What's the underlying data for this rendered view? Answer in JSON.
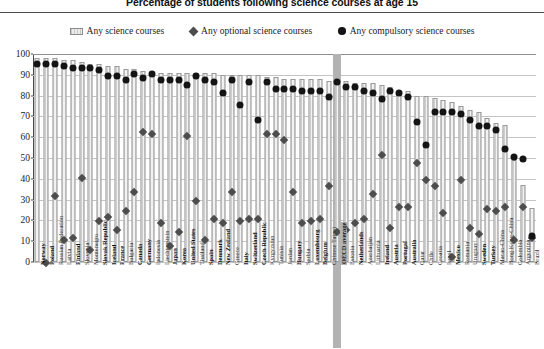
{
  "chart_data": {
    "type": "bar",
    "title": "Percentage of students following science courses at age 15",
    "xlabel": "",
    "ylabel": "Percentage of students",
    "ylim": [
      0,
      100
    ],
    "ytick_values": [
      0,
      10,
      20,
      30,
      40,
      50,
      60,
      70,
      80,
      90,
      100
    ],
    "grid": true,
    "legend_position": "top-center",
    "legend": [
      {
        "label": "Any science courses",
        "marker": "bar",
        "color": "#e6e6e6"
      },
      {
        "label": "Any optional science courses",
        "marker": "diamond",
        "color": "#4d4d4d"
      },
      {
        "label": "Any compulsory science courses",
        "marker": "circle",
        "color": "#141414"
      }
    ],
    "categories": [
      "Norway",
      "Poland",
      "Russian Federation",
      "Latvia",
      "Finland",
      "Slovenia",
      "Montenegro",
      "Slovak Republic",
      "Iceland",
      "France",
      "Bulgaria",
      "Canada",
      "Germany",
      "Indonesia",
      "Liechtenstein",
      "Japan",
      "Korea",
      "United States",
      "Thailand",
      "Spain",
      "Denmark",
      "New Zealand",
      "Greece",
      "Italy",
      "Switzerland",
      "Czech Republic",
      "Kyrgyzstan",
      "Tunisia",
      "Jordan",
      "Hungary",
      "Serbia",
      "Luxembourg",
      "Belgium",
      "Chinese Taipei",
      "OECD average",
      "Estonia",
      "Netherlands",
      "Azerbaijan",
      "Lithuania",
      "Ireland",
      "Austria",
      "Portugal",
      "Australia",
      "Qatar",
      "Chile",
      "Croatia",
      "Israel",
      "Mexico",
      "Romania",
      "Uruguay",
      "Sweden",
      "Turkey",
      "Macao-China",
      "Hong Kong-China",
      "Colombia",
      "Argentina",
      "Brazil"
    ],
    "bold_categories": [
      "Norway",
      "Poland",
      "Finland",
      "Slovak Republic",
      "Iceland",
      "France",
      "Canada",
      "Germany",
      "Japan",
      "Korea",
      "United States",
      "Spain",
      "Denmark",
      "New Zealand",
      "Italy",
      "Switzerland",
      "Czech Republic",
      "Hungary",
      "Luxembourg",
      "Belgium",
      "OECD average",
      "Netherlands",
      "Ireland",
      "Austria",
      "Portugal",
      "Australia",
      "Mexico",
      "Sweden",
      "Turkey"
    ],
    "highlight_category": "OECD average",
    "series": [
      {
        "name": "Any science courses",
        "marker": "bar",
        "values": [
          98,
          98,
          98,
          97,
          97,
          96,
          95,
          95,
          94,
          94,
          93,
          93,
          92,
          92,
          91,
          91,
          91,
          91,
          91,
          91,
          91,
          90,
          90,
          90,
          90,
          90,
          89,
          89,
          88,
          88,
          88,
          88,
          88,
          87,
          87,
          87,
          86,
          86,
          86,
          85,
          84,
          82,
          82,
          80,
          80,
          79,
          78,
          77,
          75,
          73,
          72,
          69,
          67,
          66,
          49,
          37,
          26
        ]
      },
      {
        "name": "Any optional science courses",
        "marker": "diamond",
        "values": [
          null,
          1,
          33,
          12,
          13,
          42,
          7,
          21,
          23,
          17,
          26,
          35,
          64,
          63,
          20,
          9,
          16,
          62,
          31,
          12,
          22,
          20,
          35,
          21,
          22,
          22,
          63,
          63,
          60,
          35,
          20,
          21,
          22,
          38,
          16,
          17,
          20,
          22,
          34,
          53,
          18,
          28,
          28,
          49,
          41,
          38,
          25,
          4,
          41,
          18,
          15,
          27,
          26,
          28,
          12,
          28,
          13
        ]
      },
      {
        "name": "Any compulsory science courses",
        "marker": "circle",
        "values": [
          97,
          97,
          97,
          96,
          95,
          95,
          95,
          94,
          91,
          91,
          89,
          92,
          90,
          92,
          89,
          89,
          89,
          87,
          91,
          89,
          88,
          83,
          89,
          77,
          88,
          70,
          88,
          85,
          85,
          85,
          84,
          84,
          84,
          81,
          88,
          86,
          86,
          84,
          83,
          80,
          84,
          83,
          81,
          69,
          58,
          74,
          74,
          74,
          73,
          70,
          67,
          67,
          65,
          56,
          52,
          51,
          14
        ]
      }
    ]
  }
}
